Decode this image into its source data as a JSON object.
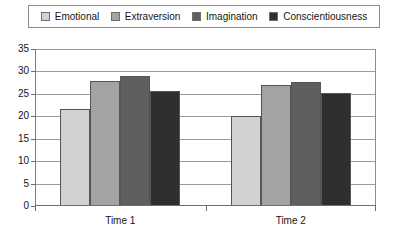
{
  "chart_data": {
    "type": "bar",
    "title": "",
    "xlabel": "",
    "ylabel": "",
    "categories": [
      "Time 1",
      "Time 2"
    ],
    "series": [
      {
        "name": "Emotional",
        "values": [
          21.7,
          20.0
        ],
        "color": "#d2d2d2"
      },
      {
        "name": "Extraversion",
        "values": [
          27.8,
          27.0
        ],
        "color": "#a3a3a3"
      },
      {
        "name": "Imagination",
        "values": [
          28.9,
          27.7
        ],
        "color": "#5f5f5f"
      },
      {
        "name": "Conscientiousness",
        "values": [
          25.7,
          25.1
        ],
        "color": "#2f2f2f"
      }
    ],
    "ylim": [
      0,
      35
    ],
    "ytick_step": 5,
    "ytick_labels": [
      "35",
      "30",
      "25",
      "20",
      "15",
      "10",
      "5",
      "0"
    ],
    "grid": true,
    "legend_position": "top",
    "plot_border": true
  },
  "legend": {
    "items": [
      {
        "label": "Emotional"
      },
      {
        "label": "Extraversion"
      },
      {
        "label": "Imagination"
      },
      {
        "label": "Conscientiousness"
      }
    ]
  },
  "axes": {
    "y_ticks": [
      {
        "label": "35",
        "value": 35
      },
      {
        "label": "30",
        "value": 30
      },
      {
        "label": "25",
        "value": 25
      },
      {
        "label": "20",
        "value": 20
      },
      {
        "label": "15",
        "value": 15
      },
      {
        "label": "10",
        "value": 10
      },
      {
        "label": "5",
        "value": 5
      },
      {
        "label": "0",
        "value": 0
      }
    ],
    "x_ticks": [
      {
        "label": "Time 1"
      },
      {
        "label": "Time 2"
      }
    ]
  }
}
